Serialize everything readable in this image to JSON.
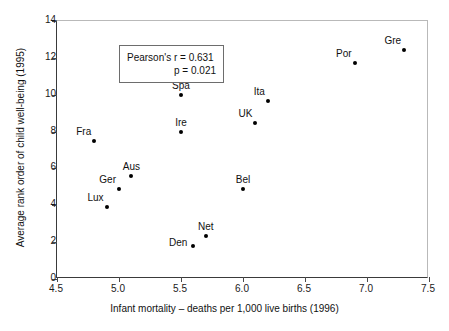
{
  "chart_data": {
    "type": "scatter",
    "title": "",
    "xlabel": "Infant mortality – deaths per 1,000 live births (1996)",
    "ylabel": "Average rank order of child well-being (1995)",
    "xlim": [
      4.5,
      7.5
    ],
    "ylim": [
      0,
      14
    ],
    "xticks": [
      "4.5",
      "5.0",
      "5.5",
      "6.0",
      "6.5",
      "7.0",
      "7.5"
    ],
    "xtick_values": [
      4.5,
      5.0,
      5.5,
      6.0,
      6.5,
      7.0,
      7.5
    ],
    "yticks": [
      "0",
      "2",
      "4",
      "6",
      "8",
      "10",
      "12",
      "14"
    ],
    "ytick_values": [
      0,
      2,
      4,
      6,
      8,
      10,
      12,
      14
    ],
    "grid": false,
    "legend": "none",
    "marker_color": "#000000",
    "points": [
      {
        "label": "Fra",
        "x": 4.8,
        "y": 7.5,
        "label_pos": "above-left"
      },
      {
        "label": "Lux",
        "x": 4.9,
        "y": 3.9,
        "label_pos": "above-left"
      },
      {
        "label": "Ger",
        "x": 5.0,
        "y": 4.9,
        "label_pos": "above-left"
      },
      {
        "label": "Aus",
        "x": 5.1,
        "y": 5.6,
        "label_pos": "above"
      },
      {
        "label": "Spa",
        "x": 5.5,
        "y": 10.0,
        "label_pos": "above"
      },
      {
        "label": "Ire",
        "x": 5.5,
        "y": 7.95,
        "label_pos": "above"
      },
      {
        "label": "Den",
        "x": 5.6,
        "y": 1.8,
        "label_pos": "left"
      },
      {
        "label": "Net",
        "x": 5.7,
        "y": 2.35,
        "label_pos": "above"
      },
      {
        "label": "Bel",
        "x": 6.0,
        "y": 4.9,
        "label_pos": "above"
      },
      {
        "label": "UK",
        "x": 6.1,
        "y": 8.45,
        "label_pos": "above-left"
      },
      {
        "label": "Ita",
        "x": 6.2,
        "y": 9.65,
        "label_pos": "above-left"
      },
      {
        "label": "Por",
        "x": 6.9,
        "y": 11.7,
        "label_pos": "above-left"
      },
      {
        "label": "Gre",
        "x": 7.3,
        "y": 12.4,
        "label_pos": "above-left"
      }
    ],
    "annotations": {
      "pearson_r": "Pearson's r = 0.631",
      "p_value": "p = 0.021"
    }
  }
}
